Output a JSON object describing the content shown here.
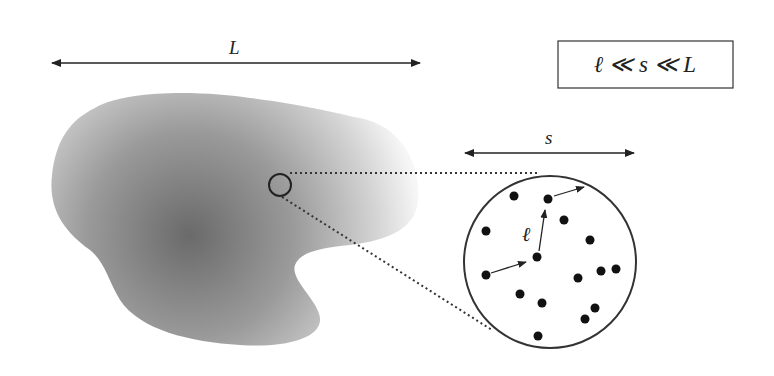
{
  "labels": {
    "large_scale": "L",
    "mesoscale": "s",
    "microscale": "ℓ",
    "inequality": "ℓ ≪ s ≪ L"
  },
  "colors": {
    "stroke": "#222222",
    "blob_dark": "#6e6e6e",
    "blob_light": "#f4f4f4",
    "background": "#ffffff"
  },
  "scale_bars": {
    "L": {
      "x1": 50,
      "x2": 422,
      "y": 63
    },
    "s": {
      "x1": 463,
      "x2": 636,
      "y": 153
    }
  },
  "magnifier": {
    "small_circle": {
      "cx": 280,
      "cy": 185,
      "r": 11
    },
    "large_circle": {
      "cx": 550,
      "cy": 262,
      "r": 86
    }
  },
  "particles": [
    {
      "x": 514,
      "y": 196
    },
    {
      "x": 548,
      "y": 199
    },
    {
      "x": 486,
      "y": 231
    },
    {
      "x": 564,
      "y": 220
    },
    {
      "x": 590,
      "y": 240
    },
    {
      "x": 537,
      "y": 257
    },
    {
      "x": 486,
      "y": 275
    },
    {
      "x": 600,
      "y": 270
    },
    {
      "x": 616,
      "y": 269
    },
    {
      "x": 578,
      "y": 278
    },
    {
      "x": 520,
      "y": 294
    },
    {
      "x": 542,
      "y": 302
    },
    {
      "x": 594,
      "y": 308
    },
    {
      "x": 585,
      "y": 318
    },
    {
      "x": 538,
      "y": 335
    }
  ]
}
